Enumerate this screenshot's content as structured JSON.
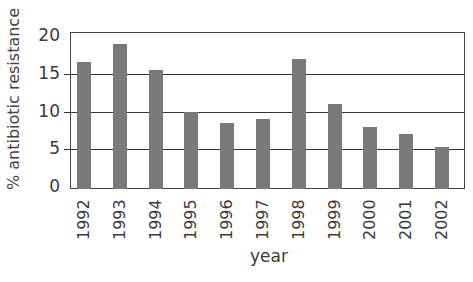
{
  "chart_data": {
    "type": "bar",
    "title": "",
    "xlabel": "year",
    "ylabel": "% antibiotic resistance",
    "categories": [
      "1992",
      "1993",
      "1994",
      "1995",
      "1996",
      "1997",
      "1998",
      "1999",
      "2000",
      "2001",
      "2002"
    ],
    "values": [
      16.5,
      19,
      15.5,
      10,
      8.5,
      9,
      17,
      11,
      8,
      7,
      5.3
    ],
    "ylim": [
      0,
      20
    ],
    "yticks": [
      0,
      5,
      10,
      15,
      20
    ],
    "grid": true,
    "legend": null,
    "bar_color": "#7a7a7a",
    "line_color": "#333333"
  }
}
